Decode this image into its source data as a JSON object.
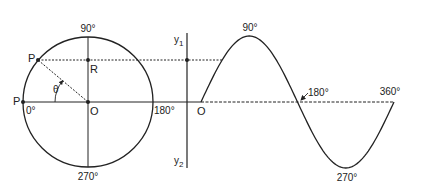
{
  "diagram": {
    "circle": {
      "labels": {
        "top": "90°",
        "bottom": "270°",
        "left": "0°",
        "right": "180°",
        "center": "O",
        "point_p_rotated": "P",
        "point_p_start": "P",
        "point_r": "R",
        "angle": "θ"
      }
    },
    "axis": {
      "y_top": "y",
      "y_top_sub": "1",
      "y_bottom": "y",
      "y_bottom_sub": "2"
    },
    "waveform": {
      "origin": "O",
      "labels": {
        "peak": "90°",
        "zero_cross": "180°",
        "trough": "270°",
        "end": "360°"
      }
    },
    "colors": {
      "stroke": "#222222",
      "background": "#ffffff"
    }
  }
}
